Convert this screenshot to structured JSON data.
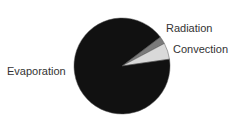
{
  "chart_data": {
    "type": "pie",
    "title": "",
    "start_angle_deg": 37,
    "direction": "clockwise",
    "slices": [
      {
        "label": "Radiation",
        "value": 2.5,
        "color": "#7a7a7a"
      },
      {
        "label": "Convection",
        "value": 5.5,
        "color": "#d9d9d9"
      },
      {
        "label": "Evaporation",
        "value": 92,
        "color": "#111111"
      }
    ],
    "legend": "none (direct labels)"
  }
}
